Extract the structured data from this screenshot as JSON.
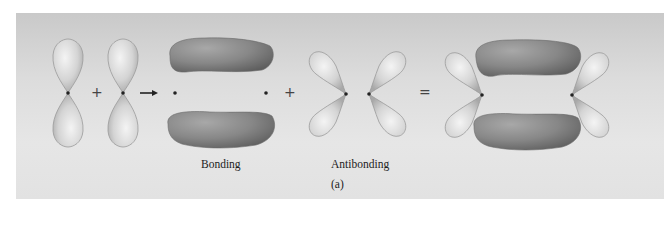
{
  "figure": {
    "labels": {
      "bonding": "Bonding",
      "antibonding": "Antibonding",
      "panel": "(a)"
    },
    "operators": {
      "plus_1": "+",
      "arrow": "→",
      "plus_2": "+",
      "equals": "="
    },
    "colors": {
      "background_top": "#c9c9c9",
      "background_bottom": "#e4e4e4",
      "p_orbital_lobe": "#d6d6d6",
      "sigma_bond_lobe": "#8c8c8c",
      "nucleus_dot": "#222222"
    },
    "components": [
      "p-orbital-vertical",
      "p-orbital-vertical",
      "bonding-pi-orbital",
      "antibonding-orbital-pair",
      "combined-orbital"
    ]
  }
}
